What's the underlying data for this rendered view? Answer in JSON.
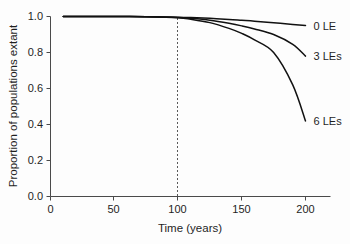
{
  "chart_data": {
    "type": "line",
    "title": "",
    "subtitle": "",
    "xlabel": "Time (years)",
    "ylabel": "Proportion of populations extant",
    "xlim": [
      0,
      220
    ],
    "ylim": [
      0.0,
      1.0
    ],
    "grid": false,
    "legend_position": "right-inline-labels",
    "xticks": [
      0,
      50,
      100,
      150,
      200
    ],
    "xtick_labels": [
      "0",
      "50",
      "100",
      "150",
      "200"
    ],
    "yticks": [
      0.0,
      0.2,
      0.4,
      0.6,
      0.8,
      1.0
    ],
    "ytick_labels": [
      "0.0",
      "0.2",
      "0.4",
      "0.6",
      "0.8",
      "1.0"
    ],
    "annotations": [
      {
        "name": "vertical-reference-line",
        "type": "vline",
        "x": 100,
        "style": "dashed",
        "label": ""
      }
    ],
    "x": [
      10,
      25,
      50,
      75,
      100,
      110,
      125,
      140,
      150,
      160,
      175,
      190,
      200
    ],
    "series": [
      {
        "name": "0 LE",
        "label": "0 LE",
        "color": "#111111",
        "values": [
          1.0,
          1.0,
          1.0,
          0.999,
          0.996,
          0.994,
          0.99,
          0.984,
          0.979,
          0.974,
          0.965,
          0.956,
          0.95
        ]
      },
      {
        "name": "3 LEs",
        "label": "3 LEs",
        "color": "#111111",
        "values": [
          1.0,
          1.0,
          1.0,
          0.999,
          0.995,
          0.99,
          0.979,
          0.962,
          0.948,
          0.931,
          0.9,
          0.845,
          0.78
        ]
      },
      {
        "name": "6 LEs",
        "label": "6 LEs",
        "color": "#111111",
        "values": [
          1.0,
          1.0,
          1.0,
          0.998,
          0.993,
          0.985,
          0.966,
          0.934,
          0.906,
          0.87,
          0.8,
          0.62,
          0.42
        ]
      }
    ]
  },
  "axes": {
    "x_title": "Time (years)",
    "y_title": "Proportion of populations extant"
  },
  "series_labels": {
    "s0": "0 LE",
    "s1": "3 LEs",
    "s2": "6 LEs"
  },
  "xticks": {
    "t0": "0",
    "t1": "50",
    "t2": "100",
    "t3": "150",
    "t4": "200"
  },
  "yticks": {
    "t0": "0.0",
    "t1": "0.2",
    "t2": "0.4",
    "t3": "0.6",
    "t4": "0.8",
    "t5": "1.0"
  }
}
